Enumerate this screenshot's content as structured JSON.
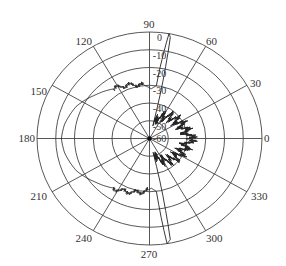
{
  "chart_data": {
    "type": "polar-line",
    "title": "",
    "angular_unit": "degrees",
    "angular_ticks": [
      0,
      30,
      60,
      90,
      120,
      150,
      180,
      210,
      240,
      270,
      300,
      330
    ],
    "angular_tick_labels": [
      "0",
      "30",
      "60",
      "90",
      "120",
      "150",
      "180",
      "210",
      "240",
      "270",
      "300",
      "330"
    ],
    "radial_ticks": [
      0,
      -10,
      -20,
      -30,
      -40,
      -50,
      -60
    ],
    "radial_tick_labels": [
      "0",
      "-10",
      "-20",
      "-30",
      "-40",
      "-50",
      "-60"
    ],
    "radial_range": [
      -60,
      0
    ],
    "radial_label_angle": 88,
    "grid": true,
    "series": [
      {
        "name": "pattern",
        "color": "#222222",
        "points": [
          {
            "angle": 0,
            "value": -38
          },
          {
            "angle": 10,
            "value": -40
          },
          {
            "angle": 20,
            "value": -41
          },
          {
            "angle": 30,
            "value": -42
          },
          {
            "angle": 40,
            "value": -43
          },
          {
            "angle": 50,
            "value": -44
          },
          {
            "angle": 60,
            "value": -46
          },
          {
            "angle": 70,
            "value": -48
          },
          {
            "angle": 76,
            "value": -52
          },
          {
            "angle": 79,
            "value": -2
          },
          {
            "angle": 80,
            "value": 0
          },
          {
            "angle": 83,
            "value": -30
          },
          {
            "angle": 88,
            "value": -32
          },
          {
            "angle": 95,
            "value": -30
          },
          {
            "angle": 110,
            "value": -28
          },
          {
            "angle": 125,
            "value": -26
          },
          {
            "angle": 140,
            "value": -22
          },
          {
            "angle": 155,
            "value": -17
          },
          {
            "angle": 170,
            "value": -14
          },
          {
            "angle": 180,
            "value": -13
          },
          {
            "angle": 190,
            "value": -14
          },
          {
            "angle": 205,
            "value": -17
          },
          {
            "angle": 220,
            "value": -22
          },
          {
            "angle": 235,
            "value": -26
          },
          {
            "angle": 250,
            "value": -28
          },
          {
            "angle": 265,
            "value": -30
          },
          {
            "angle": 272,
            "value": -32
          },
          {
            "angle": 277,
            "value": -30
          },
          {
            "angle": 279,
            "value": 0
          },
          {
            "angle": 281,
            "value": -2
          },
          {
            "angle": 284,
            "value": -52
          },
          {
            "angle": 290,
            "value": -48
          },
          {
            "angle": 300,
            "value": -46
          },
          {
            "angle": 310,
            "value": -44
          },
          {
            "angle": 320,
            "value": -43
          },
          {
            "angle": 330,
            "value": -42
          },
          {
            "angle": 340,
            "value": -41
          },
          {
            "angle": 350,
            "value": -40
          },
          {
            "angle": 360,
            "value": -38
          }
        ]
      }
    ]
  }
}
